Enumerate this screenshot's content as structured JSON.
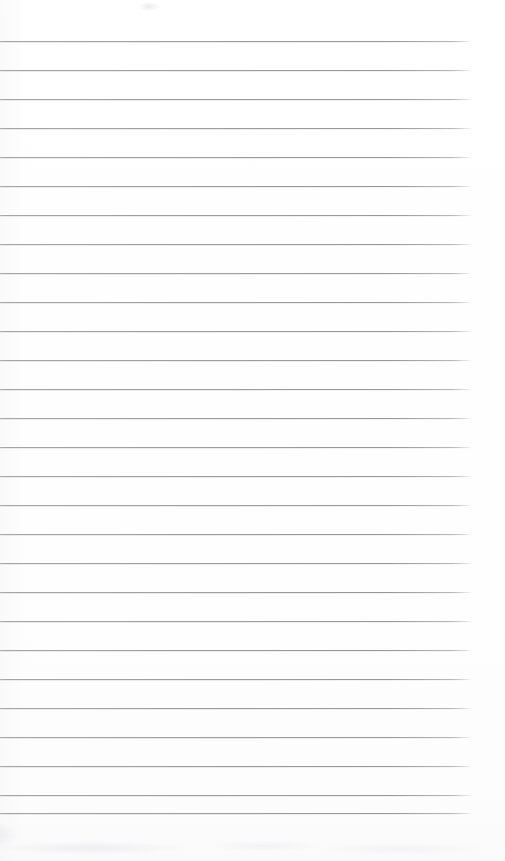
{
  "document": {
    "kind": "scanned-ruled-notebook-page",
    "title": "Blank ruled notebook page",
    "text_content": "",
    "written_text_present": "no",
    "page_width_px": 505,
    "page_height_px": 861,
    "background_color": "#fefefe",
    "paper_tone_color": "#fdfdfd"
  },
  "ruling": {
    "line_color": "#989899",
    "line_ghost_color": "#c8c8cb",
    "line_count": 27,
    "line_thickness_px": 1,
    "line_spacing_px": 29,
    "first_line_y_px": 41,
    "last_line_y_px": 813,
    "line_start_x_px": 0,
    "line_end_x_px": 472,
    "line_length_px": 472,
    "right_margin_px": 33,
    "lines_y": [
      41,
      70,
      99,
      128,
      157,
      186,
      215,
      244,
      273,
      302,
      331,
      360,
      389,
      418,
      447,
      476,
      505,
      534,
      563,
      592,
      621,
      650,
      679,
      708,
      737,
      766,
      795,
      813
    ],
    "line_labels": [
      "rule-line-1",
      "rule-line-2",
      "rule-line-3",
      "rule-line-4",
      "rule-line-5",
      "rule-line-6",
      "rule-line-7",
      "rule-line-8",
      "rule-line-9",
      "rule-line-10",
      "rule-line-11",
      "rule-line-12",
      "rule-line-13",
      "rule-line-14",
      "rule-line-15",
      "rule-line-16",
      "rule-line-17",
      "rule-line-18",
      "rule-line-19",
      "rule-line-20",
      "rule-line-21",
      "rule-line-22",
      "rule-line-23",
      "rule-line-24",
      "rule-line-25",
      "rule-line-26",
      "rule-line-27",
      "rule-line-28"
    ]
  },
  "artifacts": {
    "top_smudge": {
      "label": "faint-scan-smudge",
      "x": 138,
      "y": 2,
      "width": 22,
      "height": 9
    },
    "bottom_smudge": {
      "label": "faint-scan-shadow",
      "x": 0,
      "y": 836,
      "width": 505,
      "height": 25
    },
    "left_smudge": {
      "label": "faint-edge-shadow",
      "x": 0,
      "y": 824,
      "width": 16,
      "height": 22
    }
  }
}
